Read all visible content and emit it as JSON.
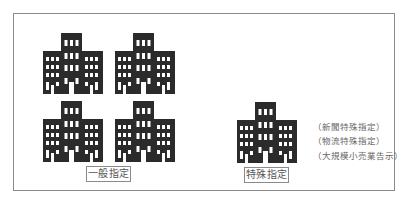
{
  "diagram": {
    "general_group": {
      "label": "一般指定",
      "building_count": 4,
      "icon": "office-building-icon"
    },
    "special_group": {
      "label": "特殊指定",
      "building_count": 1,
      "icon": "office-building-icon",
      "notes": [
        "（新聞特殊指定）",
        "（物流特殊指定）",
        "（大規模小売業告示）"
      ]
    },
    "colors": {
      "building": "#2b2b2b",
      "window": "#ffffff",
      "frame": "#8a8a8a",
      "text": "#555555"
    }
  }
}
